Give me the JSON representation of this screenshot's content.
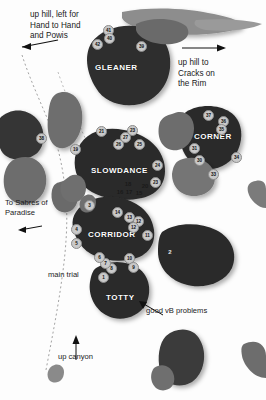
{
  "map": {
    "title": "Climbing area boulder topo",
    "colors": {
      "boulder_dark": "#2b2b2b",
      "boulder_mid": "#6e6e6e",
      "boulder_light": "#8f8f8f",
      "background": "#ffffff",
      "marker_fill": "#c9c9c9",
      "marker_text": "#111111",
      "label_text": "#ffffff",
      "note_text": "#1a1a1a",
      "trail_stroke": "#9a9a9a"
    },
    "boulders": [
      {
        "name": "GLEANER",
        "label": "GLEANER"
      },
      {
        "name": "SLOWDANCE",
        "label": "SLOWDANCE"
      },
      {
        "name": "CORNER",
        "label": "CORNER"
      },
      {
        "name": "CORRIDOR",
        "label": "CORRIDOR"
      },
      {
        "name": "TOTTY",
        "label": "TOTTY"
      }
    ],
    "notes": [
      {
        "name": "up-hill-left",
        "text": "up hill, left for\nHand to Hand\nand Powis"
      },
      {
        "name": "up-hill-right",
        "text": "up hill to\nCracks on\nthe Rim"
      },
      {
        "name": "to-sabres",
        "text": "To Sabres of\nParadise"
      },
      {
        "name": "main-trail",
        "text": "main trial"
      },
      {
        "name": "up-canyon",
        "text": "up canyon"
      },
      {
        "name": "good-vb",
        "text": "good vB problems"
      }
    ],
    "markers": {
      "gleaner": [
        "41",
        "40",
        "42",
        "39"
      ],
      "slowdance": [
        "21",
        "23",
        "27",
        "26",
        "25",
        "24",
        "19",
        "18",
        "20",
        "16",
        "17",
        "15",
        "23b"
      ],
      "corner": [
        "37",
        "36",
        "35",
        "31",
        "30",
        "33",
        "34"
      ],
      "corridor": [
        "14",
        "13",
        "12",
        "11",
        "10",
        "9",
        "8",
        "7",
        "6",
        "5",
        "4",
        "3",
        "1"
      ],
      "left": [
        "38"
      ],
      "totty_east": [
        "2"
      ]
    }
  }
}
